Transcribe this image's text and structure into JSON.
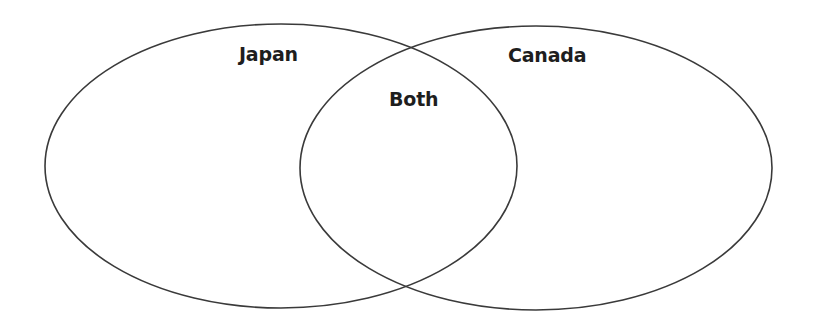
{
  "diagram": {
    "type": "venn",
    "sets": [
      {
        "id": "left",
        "label": "Japan"
      },
      {
        "id": "right",
        "label": "Canada"
      }
    ],
    "intersection": {
      "label": "Both"
    },
    "colors": {
      "stroke": "#3a3a3a",
      "text": "#1e1e1e",
      "background": "#ffffff"
    }
  }
}
